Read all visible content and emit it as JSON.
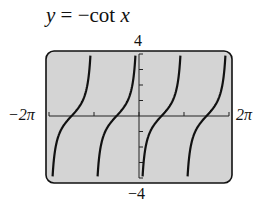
{
  "title": {
    "y": "y",
    "eq": " = −cot ",
    "x": "x"
  },
  "labels": {
    "ymax": "4",
    "ymin": "−4",
    "xmin": "−2π",
    "xmax": "2π"
  },
  "chart_data": {
    "type": "line",
    "title": "y = −cot x",
    "function": "-cot(x)",
    "xlim": [
      -6.2832,
      6.2832
    ],
    "ylim": [
      -4,
      4
    ],
    "x_tick_labels": [
      "−2π",
      "2π"
    ],
    "y_tick_labels": [
      "4",
      "−4"
    ],
    "x_ticks": [
      "−2π",
      "−π",
      "0",
      "π",
      "2π"
    ],
    "y_ticks": [
      -4,
      -3,
      -2,
      -1,
      0,
      1,
      2,
      3,
      4
    ],
    "asymptotes": [
      "−2π",
      "−π",
      "0",
      "π",
      "2π"
    ],
    "grid": false,
    "background": "#d4d4d4"
  }
}
